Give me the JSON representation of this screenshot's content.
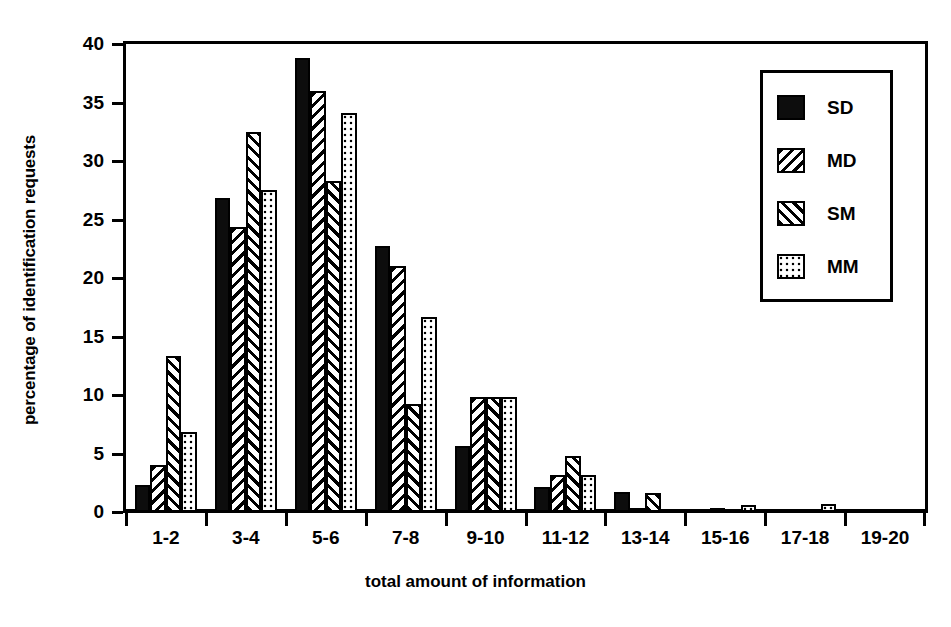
{
  "chart_data": {
    "type": "bar",
    "title": "",
    "xlabel": "total amount of information",
    "ylabel": "percentage of identification requests",
    "categories": [
      "1-2",
      "3-4",
      "5-6",
      "7-8",
      "9-10",
      "11-12",
      "13-14",
      "15-16",
      "17-18",
      "19-20"
    ],
    "series": [
      {
        "name": "SD",
        "pattern": "solid",
        "values": [
          2.3,
          26.8,
          38.8,
          22.7,
          5.6,
          2.1,
          1.7,
          0,
          0,
          0
        ]
      },
      {
        "name": "MD",
        "pattern": "backslash",
        "values": [
          4.0,
          24.4,
          36.0,
          21.0,
          9.8,
          3.2,
          0.3,
          0.3,
          0,
          0
        ]
      },
      {
        "name": "SM",
        "pattern": "slash",
        "values": [
          13.3,
          32.5,
          28.3,
          9.2,
          9.8,
          4.8,
          1.6,
          0,
          0,
          0
        ]
      },
      {
        "name": "MM",
        "pattern": "dots",
        "values": [
          6.8,
          27.5,
          34.1,
          16.7,
          9.8,
          3.2,
          0,
          0.6,
          0.7,
          0
        ]
      }
    ],
    "ylim": [
      0,
      40
    ],
    "yticks": [
      0,
      5,
      10,
      15,
      20,
      25,
      30,
      35,
      40
    ],
    "ytick_labels": [
      "0",
      "5",
      "10",
      "15",
      "20",
      "25",
      "30",
      "35",
      "40"
    ],
    "grid": false,
    "legend_position": "top-right",
    "legend_entries": [
      "SD",
      "MD",
      "SM",
      "MM"
    ]
  },
  "legend": {
    "items": [
      {
        "label": "SD"
      },
      {
        "label": "MD"
      },
      {
        "label": "SM"
      },
      {
        "label": "MM"
      }
    ]
  },
  "axes": {
    "x_title": "total amount of information",
    "y_title": "percentage of identification requests"
  }
}
